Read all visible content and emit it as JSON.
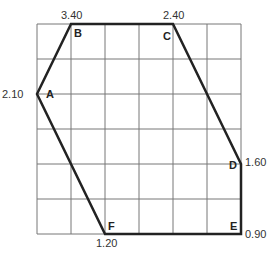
{
  "diagram": {
    "grid": {
      "cols": 6,
      "rows": 6,
      "left": 37,
      "top": 24,
      "cell_w": 34,
      "cell_h": 35,
      "line_color": "#777777"
    },
    "outline_color": "#222222",
    "vertices": [
      {
        "id": "A",
        "x": 37,
        "y": 94,
        "value": "2.10"
      },
      {
        "id": "B",
        "x": 71,
        "y": 24,
        "value": "3.40"
      },
      {
        "id": "C",
        "x": 173,
        "y": 24,
        "value": "2.40"
      },
      {
        "id": "D",
        "x": 241,
        "y": 164,
        "value": "1.60"
      },
      {
        "id": "E",
        "x": 241,
        "y": 234,
        "value": "0.90"
      },
      {
        "id": "F",
        "x": 105,
        "y": 234,
        "value": "1.20"
      }
    ]
  }
}
